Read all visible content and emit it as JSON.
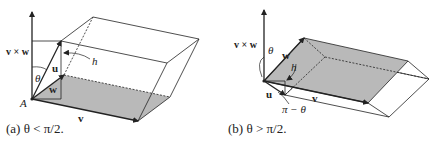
{
  "figure_a": {
    "caption": "(a) θ < π/2.",
    "labels": {
      "cross": "v × w",
      "u": "u",
      "w": "w",
      "v": "v",
      "theta": "θ",
      "h": "h",
      "origin": "A"
    }
  },
  "figure_b": {
    "caption": "(b) θ > π/2.",
    "labels": {
      "cross": "v × w",
      "u": "u",
      "w": "w",
      "v": "v",
      "theta": "θ",
      "h": "h",
      "pi_minus_theta": "π − θ"
    }
  },
  "colors": {
    "line": "#222222",
    "shade": "#b9b9b9"
  }
}
